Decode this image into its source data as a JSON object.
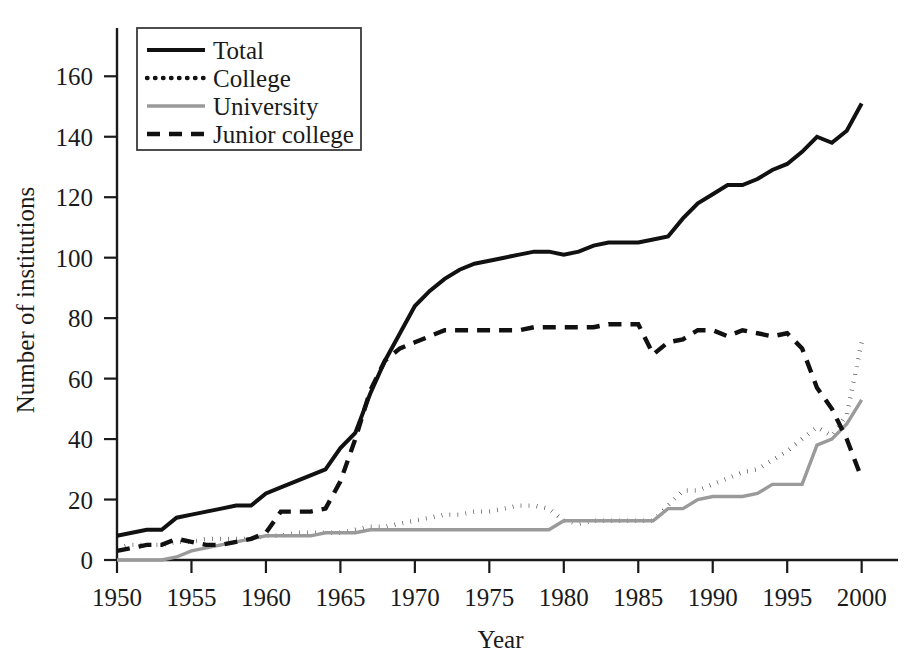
{
  "chart_data": {
    "type": "line",
    "title": "",
    "xlabel": "Year",
    "ylabel": "Number of institutions",
    "xlim": [
      1950,
      2001.5
    ],
    "ylim": [
      0,
      172
    ],
    "xticks": [
      1950,
      1955,
      1960,
      1965,
      1970,
      1975,
      1980,
      1985,
      1990,
      1995,
      2000
    ],
    "yticks": [
      0,
      20,
      40,
      60,
      80,
      100,
      120,
      140,
      160
    ],
    "grid": false,
    "legend_position": "top-left",
    "x": [
      1950,
      1951,
      1952,
      1953,
      1954,
      1955,
      1956,
      1957,
      1958,
      1959,
      1960,
      1961,
      1962,
      1963,
      1964,
      1965,
      1966,
      1967,
      1968,
      1969,
      1970,
      1971,
      1972,
      1973,
      1974,
      1975,
      1976,
      1977,
      1978,
      1979,
      1980,
      1981,
      1982,
      1983,
      1984,
      1985,
      1986,
      1987,
      1988,
      1989,
      1990,
      1991,
      1992,
      1993,
      1994,
      1995,
      1996,
      1997,
      1998,
      1999,
      2000
    ],
    "series": [
      {
        "name": "Total",
        "style": "solid",
        "color": "#111111",
        "values": [
          8,
          9,
          10,
          10,
          14,
          15,
          16,
          17,
          18,
          18,
          22,
          24,
          26,
          28,
          30,
          37,
          42,
          55,
          66,
          75,
          84,
          89,
          93,
          96,
          98,
          99,
          100,
          101,
          102,
          102,
          101,
          102,
          104,
          105,
          105,
          105,
          106,
          107,
          113,
          118,
          121,
          124,
          124,
          126,
          129,
          131,
          135,
          140,
          138,
          142,
          151
        ]
      },
      {
        "name": "College",
        "style": "dotted",
        "color": "#111111",
        "values": [
          4,
          5,
          5,
          5,
          6,
          6,
          7,
          7,
          7,
          7,
          8,
          8,
          9,
          9,
          9,
          9,
          10,
          11,
          11,
          12,
          13,
          14,
          15,
          15,
          16,
          16,
          17,
          18,
          18,
          17,
          13,
          12,
          13,
          13,
          13,
          13,
          13,
          18,
          23,
          23,
          25,
          27,
          29,
          30,
          33,
          36,
          40,
          44,
          41,
          48,
          72
        ]
      },
      {
        "name": "University",
        "style": "solid-gray",
        "color": "#9a9a9a",
        "values": [
          0,
          0,
          0,
          0,
          1,
          3,
          4,
          5,
          6,
          7,
          8,
          8,
          8,
          8,
          9,
          9,
          9,
          10,
          10,
          10,
          10,
          10,
          10,
          10,
          10,
          10,
          10,
          10,
          10,
          10,
          13,
          13,
          13,
          13,
          13,
          13,
          13,
          17,
          17,
          20,
          21,
          21,
          21,
          22,
          25,
          25,
          25,
          38,
          40,
          45,
          53
        ]
      },
      {
        "name": "Junior college",
        "style": "dashed",
        "color": "#111111",
        "values": [
          3,
          4,
          5,
          5,
          7,
          6,
          5,
          5,
          6,
          7,
          9,
          16,
          16,
          16,
          17,
          26,
          40,
          56,
          66,
          70,
          72,
          74,
          76,
          76,
          76,
          76,
          76,
          76,
          77,
          77,
          77,
          77,
          77,
          78,
          78,
          78,
          68,
          72,
          73,
          76,
          76,
          74,
          76,
          75,
          74,
          75,
          70,
          57,
          50,
          40,
          27
        ]
      }
    ]
  },
  "legend": {
    "entries": [
      {
        "label": "Total",
        "style": "solid"
      },
      {
        "label": "College",
        "style": "dotted"
      },
      {
        "label": "University",
        "style": "solid-gray"
      },
      {
        "label": "Junior college",
        "style": "dashed"
      }
    ]
  },
  "axes": {
    "y_title": "Number of institutions",
    "x_title": "Year",
    "y_tick_labels": [
      "0",
      "20",
      "40",
      "60",
      "80",
      "100",
      "120",
      "140",
      "160"
    ],
    "x_tick_labels": [
      "1950",
      "1955",
      "1960",
      "1965",
      "1970",
      "1975",
      "1980",
      "1985",
      "1990",
      "1995",
      "2000"
    ]
  }
}
